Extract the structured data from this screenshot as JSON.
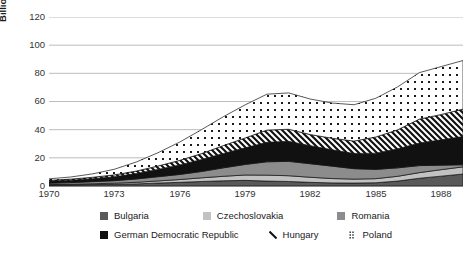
{
  "chart_data": {
    "type": "area",
    "title": "",
    "subtitle": "",
    "xlabel": "",
    "ylabel": "Billions of $",
    "stacked": true,
    "grid": true,
    "legend_position": "bottom",
    "xlim": [
      1970,
      1989
    ],
    "ylim": [
      0,
      120
    ],
    "yticks": [
      0,
      20,
      40,
      60,
      80,
      100,
      120
    ],
    "xticks": [
      1970,
      1973,
      1976,
      1979,
      1982,
      1985,
      1988
    ],
    "x": [
      1970,
      1971,
      1972,
      1973,
      1974,
      1975,
      1976,
      1977,
      1978,
      1979,
      1980,
      1981,
      1982,
      1983,
      1984,
      1985,
      1986,
      1987,
      1988,
      1989
    ],
    "series": [
      {
        "name": "Bulgaria",
        "fill": "pattern-solid",
        "color": "#595959",
        "values": [
          0.7,
          0.8,
          1.0,
          1.2,
          1.5,
          2.1,
          2.6,
          3.2,
          3.7,
          4.0,
          3.5,
          3.2,
          2.6,
          2.2,
          2.1,
          2.3,
          3.5,
          5.5,
          7.0,
          8.5
        ]
      },
      {
        "name": "Czechoslovakia",
        "fill": "pattern-solid",
        "color": "#c2c2c2",
        "values": [
          0.3,
          0.4,
          0.6,
          0.8,
          1.1,
          1.5,
          2.0,
          2.6,
          3.2,
          3.8,
          4.2,
          4.1,
          3.6,
          3.1,
          2.8,
          2.9,
          3.4,
          4.0,
          4.6,
          5.1
        ]
      },
      {
        "name": "Romania",
        "fill": "pattern-solid",
        "color": "#8c8c8c",
        "values": [
          1.0,
          1.2,
          1.5,
          1.8,
          2.4,
          3.0,
          3.6,
          4.5,
          6.0,
          7.5,
          9.5,
          10.2,
          9.6,
          8.8,
          7.4,
          6.6,
          6.0,
          5.0,
          3.2,
          1.5
        ]
      },
      {
        "name": "German Democratic Republic",
        "fill": "pattern-solid",
        "color": "#111111",
        "values": [
          1.4,
          1.7,
          2.1,
          2.8,
          3.8,
          5.2,
          6.8,
          8.5,
          10.2,
          11.8,
          13.8,
          14.2,
          12.8,
          11.6,
          10.8,
          11.5,
          13.5,
          16.0,
          18.0,
          20.0
        ]
      },
      {
        "name": "Hungary",
        "fill": "pattern-diagonal",
        "color": "#ffffff",
        "values": [
          0.6,
          0.8,
          1.0,
          1.3,
          1.8,
          2.4,
          3.2,
          4.2,
          5.6,
          7.0,
          8.7,
          8.6,
          7.9,
          8.2,
          8.8,
          11.5,
          13.5,
          17.0,
          18.0,
          19.5
        ]
      },
      {
        "name": "Poland",
        "fill": "pattern-dotted",
        "color": "#ffffff",
        "values": [
          1.1,
          1.5,
          2.4,
          4.0,
          6.4,
          9.4,
          13.0,
          17.0,
          20.5,
          23.5,
          25.5,
          25.8,
          25.2,
          25.0,
          25.8,
          27.5,
          30.5,
          33.0,
          34.0,
          34.5
        ]
      }
    ]
  },
  "axis": {
    "ylabel": "Billions of $",
    "yticks": [
      "0",
      "20",
      "40",
      "60",
      "80",
      "100",
      "120"
    ],
    "xticks": [
      "1970",
      "1973",
      "1976",
      "1979",
      "1982",
      "1985",
      "1988"
    ]
  },
  "legend": {
    "row1": [
      {
        "label": "Bulgaria",
        "swatch": "solid-dark-gray",
        "color": "#595959"
      },
      {
        "label": "Czechoslovakia",
        "swatch": "solid-light-gray",
        "color": "#c2c2c2"
      },
      {
        "label": "Romania",
        "swatch": "solid-mid-gray",
        "color": "#8c8c8c"
      }
    ],
    "row2": [
      {
        "label": "German Democratic Republic",
        "swatch": "solid-black",
        "color": "#111111"
      },
      {
        "label": "Hungary",
        "swatch": "diagonal-hatch",
        "color": "#ffffff"
      },
      {
        "label": "Poland",
        "swatch": "dotted",
        "color": "#ffffff"
      }
    ]
  }
}
